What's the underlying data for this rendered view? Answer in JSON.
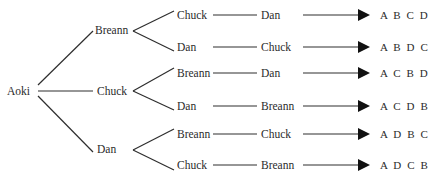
{
  "diagram": {
    "type": "tree-diagram",
    "root": {
      "label": "Aoki"
    },
    "level1": [
      {
        "label": "Breann",
        "children": [
          {
            "label": "Chuck",
            "next": "Dan",
            "result": "A B C D"
          },
          {
            "label": "Dan",
            "next": "Chuck",
            "result": "A B D C"
          }
        ]
      },
      {
        "label": "Chuck",
        "children": [
          {
            "label": "Breann",
            "next": "Dan",
            "result": "A C B D"
          },
          {
            "label": "Dan",
            "next": "Breann",
            "result": "A C D B"
          }
        ]
      },
      {
        "label": "Dan",
        "children": [
          {
            "label": "Breann",
            "next": "Chuck",
            "result": "A D B C"
          },
          {
            "label": "Chuck",
            "next": "Breann",
            "result": "A D C B"
          }
        ]
      }
    ],
    "colors": {
      "line": "#2e2e2e",
      "arrowhead": "#111111",
      "text": "#2b2b2b",
      "background": "#ffffff"
    }
  }
}
